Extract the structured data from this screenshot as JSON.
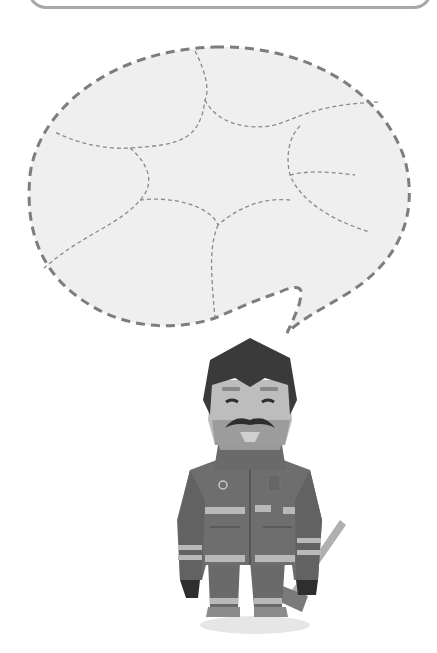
{
  "canvas": {
    "width": 437,
    "height": 653,
    "background": "#ffffff"
  },
  "top_box": {
    "border_color": "#a8a8a8"
  },
  "speech_bubble": {
    "fill": "#efefef",
    "outline_color": "#7d7d7d",
    "outline_style": "dashed",
    "inner_lines_color": "#8a8a8a",
    "inner_lines_style": "dashed",
    "segments": 9
  },
  "character": {
    "type": "firefighter",
    "features": [
      "dark-hair",
      "mustache",
      "goatee",
      "closed-eyes",
      "turnout-coat",
      "reflective-stripes",
      "gloves",
      "axe"
    ],
    "colors": {
      "hair": "#3a3a3a",
      "skin": "#bdbdbd",
      "beard": "#9a9a9a",
      "coat": "#6e6e6e",
      "coat_dark": "#5c5c5c",
      "stripe": "#b9b9b9",
      "gloves": "#2e2e2e",
      "shadow": "#e6e6e6"
    }
  }
}
